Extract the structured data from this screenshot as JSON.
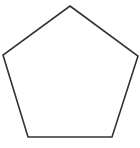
{
  "diagram": {
    "shape": "pentagon",
    "stroke_color": "#333333",
    "fill_color": "#ffffff",
    "stroke_width": 1.6,
    "vertices": [
      {
        "x": 70,
        "y": 6
      },
      {
        "x": 138,
        "y": 56
      },
      {
        "x": 112,
        "y": 137
      },
      {
        "x": 28,
        "y": 137
      },
      {
        "x": 3,
        "y": 55
      }
    ]
  }
}
